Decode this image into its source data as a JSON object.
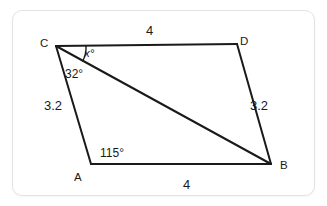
{
  "figure": {
    "type": "geometry-quadrilateral-diagram",
    "stroke_color": "#1a1a1a",
    "background_color": "#ffffff",
    "card_border_color": "#e3e3e3",
    "vertices": [
      {
        "name": "C",
        "label": "C",
        "x": 56,
        "y": 46,
        "label_x": 40,
        "label_y": 38
      },
      {
        "name": "D",
        "label": "D",
        "x": 237,
        "y": 44,
        "label_x": 240,
        "label_y": 36
      },
      {
        "name": "B",
        "label": "B",
        "x": 271,
        "y": 164,
        "label_x": 280,
        "label_y": 160
      },
      {
        "name": "A",
        "label": "A",
        "x": 91,
        "y": 164,
        "label_x": 74,
        "label_y": 172
      }
    ],
    "edges": [
      {
        "name": "edge-CD",
        "from": "C",
        "to": "D"
      },
      {
        "name": "edge-DB",
        "from": "D",
        "to": "B"
      },
      {
        "name": "edge-BA",
        "from": "B",
        "to": "A"
      },
      {
        "name": "edge-AC",
        "from": "A",
        "to": "C"
      },
      {
        "name": "diagonal-CB",
        "from": "C",
        "to": "B"
      }
    ],
    "side_labels": [
      {
        "name": "side-label-cd",
        "text": "4",
        "x": 146,
        "y": 24
      },
      {
        "name": "side-label-ab",
        "text": "4",
        "x": 183,
        "y": 178
      },
      {
        "name": "side-label-ca",
        "text": "3.2",
        "x": 44,
        "y": 99
      },
      {
        "name": "side-label-db",
        "text": "3.2",
        "x": 250,
        "y": 99
      }
    ],
    "angle_labels": [
      {
        "name": "angle-label-x",
        "text": "x°",
        "x": 84,
        "y": 48
      },
      {
        "name": "angle-label-32",
        "text": "32°",
        "x": 65,
        "y": 68
      },
      {
        "name": "angle-label-115",
        "text": "115°",
        "x": 100,
        "y": 147
      }
    ]
  }
}
